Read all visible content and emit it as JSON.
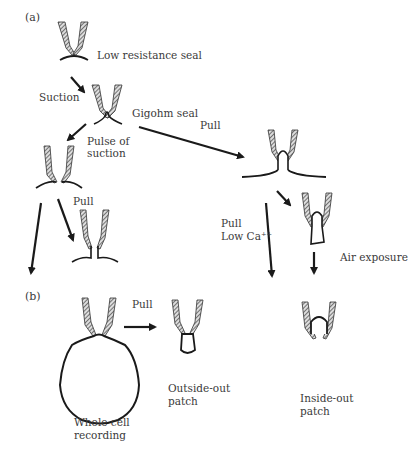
{
  "panels": {
    "a": {
      "label": "(a)"
    },
    "b": {
      "label": "(b)"
    }
  },
  "labels": {
    "low_resistance_seal": "Low resistance seal",
    "suction": "Suction",
    "gigohm_seal": "Gigohm seal",
    "pulse_of_suction_1": "Pulse of",
    "pulse_of_suction_2": "suction",
    "pull_top": "Pull",
    "pull_left": "Pull",
    "pull_low_ca_1": "Pull",
    "pull_low_ca_2": "Low Ca⁺⁺",
    "air_exposure": "Air exposure",
    "pull_b": "Pull",
    "whole_cell_1": "Whole cell",
    "whole_cell_2": "recording",
    "outside_out_1": "Outside-out",
    "outside_out_2": "patch",
    "inside_out_1": "Inside-out",
    "inside_out_2": "patch"
  },
  "colors": {
    "ink": "#1a1a1a",
    "text": "#3a3a3a",
    "hatch": "#666666"
  }
}
